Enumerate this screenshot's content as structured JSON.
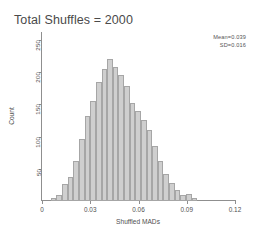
{
  "chart_data": {
    "type": "bar",
    "title": "Total Shuffles = 2000",
    "xlabel": "Shuffled MADs",
    "ylabel": "Count",
    "xlim": [
      0,
      0.12
    ],
    "ylim": [
      0,
      262
    ],
    "grid": false,
    "legend": null,
    "xticks": [
      "0",
      "0.03",
      "0.06",
      "0.09",
      "0.12"
    ],
    "xtick_values": [
      0,
      0.03,
      0.06,
      0.09,
      0.12
    ],
    "yticks": [
      "50",
      "100",
      "150",
      "200",
      "250"
    ],
    "ytick_values": [
      50,
      100,
      150,
      200,
      250
    ],
    "bin_width": 0.0035,
    "bin_starts": [
      0.0055,
      0.009,
      0.0125,
      0.016,
      0.0195,
      0.023,
      0.0265,
      0.03,
      0.0335,
      0.037,
      0.0405,
      0.044,
      0.0475,
      0.051,
      0.0545,
      0.058,
      0.0615,
      0.065,
      0.0685,
      0.072,
      0.0755,
      0.079,
      0.0825,
      0.086,
      0.0895,
      0.093
    ],
    "values": [
      4,
      10,
      26,
      38,
      62,
      96,
      132,
      155,
      185,
      205,
      220,
      207,
      196,
      178,
      152,
      139,
      126,
      110,
      86,
      62,
      42,
      28,
      17,
      9,
      11,
      4
    ],
    "annotations": [
      {
        "name": "mean",
        "text": "Mean=0.039"
      },
      {
        "name": "sd",
        "text": "SD=0.016"
      }
    ],
    "colors": {
      "bar_fill": "#cfcfcf",
      "bar_edge": "#a6a6a6",
      "axis": "#8f8f8f",
      "text": "#4a4a4a"
    }
  }
}
